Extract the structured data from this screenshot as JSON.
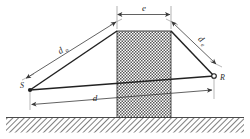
{
  "figure": {
    "background_color": "#ffffff",
    "line_color": "#2a2a2a",
    "dimension_color": "#8a8a8a",
    "obstacle_fill": "#b4b4b4",
    "ground_color": "#6e6e6e"
  },
  "labels": {
    "source_point": "S",
    "receiver_point": "R",
    "left_path": "d",
    "left_path_sub": "o",
    "right_path": "d",
    "right_path_sub": "e",
    "top_width": "e",
    "baseline": "d"
  },
  "geometry": {
    "source": {
      "x": 30,
      "y": 90
    },
    "receiver": {
      "x": 214,
      "y": 76
    },
    "obstacle": {
      "left": 117,
      "right": 171,
      "top": 31,
      "bottom": 117
    },
    "ground_y": 117,
    "ground_bottom": 133
  },
  "elements": {
    "obstacle_name": "obstacle-block",
    "ground_name": "ground-hatch",
    "los_name": "line-of-sight",
    "left_ray_name": "left-ray",
    "right_ray_name": "right-ray"
  }
}
